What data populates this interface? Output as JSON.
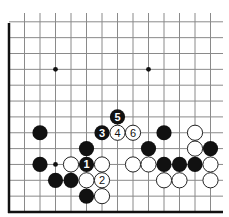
{
  "diagram": {
    "grid": {
      "origin_x": 9,
      "origin_y": 212,
      "spacing_x": 15.5,
      "spacing_y": 15.85,
      "columns": 14,
      "rows": 13,
      "right_extent": 223,
      "top_extent": 13,
      "left_border": true,
      "bottom_border": true
    },
    "star_points": [
      {
        "col": 3,
        "row": 9
      },
      {
        "col": 9,
        "row": 9
      },
      {
        "col": 3,
        "row": 3
      }
    ],
    "stones": [
      {
        "color": "black",
        "col": 2,
        "row": 5,
        "label": ""
      },
      {
        "color": "black",
        "col": 2,
        "row": 3,
        "label": ""
      },
      {
        "color": "white",
        "col": 4,
        "row": 3,
        "label": ""
      },
      {
        "color": "black",
        "col": 5,
        "row": 3,
        "label": "1"
      },
      {
        "color": "white",
        "col": 6,
        "row": 3,
        "label": ""
      },
      {
        "color": "black",
        "col": 5,
        "row": 4,
        "label": ""
      },
      {
        "color": "black",
        "col": 6,
        "row": 5,
        "label": "3"
      },
      {
        "color": "white",
        "col": 7,
        "row": 5,
        "label": "4"
      },
      {
        "color": "black",
        "col": 7,
        "row": 6,
        "label": "5"
      },
      {
        "color": "white",
        "col": 8,
        "row": 5,
        "label": "6"
      },
      {
        "color": "black",
        "col": 3,
        "row": 2,
        "label": ""
      },
      {
        "color": "black",
        "col": 4,
        "row": 2,
        "label": ""
      },
      {
        "color": "white",
        "col": 5,
        "row": 2,
        "label": ""
      },
      {
        "color": "white",
        "col": 6,
        "row": 2,
        "label": "2"
      },
      {
        "color": "black",
        "col": 5,
        "row": 1,
        "label": ""
      },
      {
        "color": "white",
        "col": 6,
        "row": 1,
        "label": ""
      },
      {
        "color": "black",
        "col": 10,
        "row": 5,
        "label": ""
      },
      {
        "color": "white",
        "col": 12,
        "row": 5,
        "label": ""
      },
      {
        "color": "black",
        "col": 9,
        "row": 4,
        "label": ""
      },
      {
        "color": "white",
        "col": 12,
        "row": 4,
        "label": ""
      },
      {
        "color": "black",
        "col": 13,
        "row": 4,
        "label": ""
      },
      {
        "color": "white",
        "col": 8,
        "row": 3,
        "label": ""
      },
      {
        "color": "white",
        "col": 9,
        "row": 3,
        "label": ""
      },
      {
        "color": "black",
        "col": 10,
        "row": 3,
        "label": ""
      },
      {
        "color": "black",
        "col": 11,
        "row": 3,
        "label": ""
      },
      {
        "color": "black",
        "col": 12,
        "row": 3,
        "label": ""
      },
      {
        "color": "white",
        "col": 13,
        "row": 3,
        "label": ""
      },
      {
        "color": "white",
        "col": 10,
        "row": 2,
        "label": ""
      },
      {
        "color": "white",
        "col": 11,
        "row": 2,
        "label": ""
      },
      {
        "color": "white",
        "col": 13,
        "row": 2,
        "label": ""
      }
    ],
    "stone_radius": 7.6,
    "colors": {
      "black_stone": "#111111",
      "white_stone": "#ffffff",
      "grid": "#8a8a8a",
      "border": "#111111"
    }
  }
}
